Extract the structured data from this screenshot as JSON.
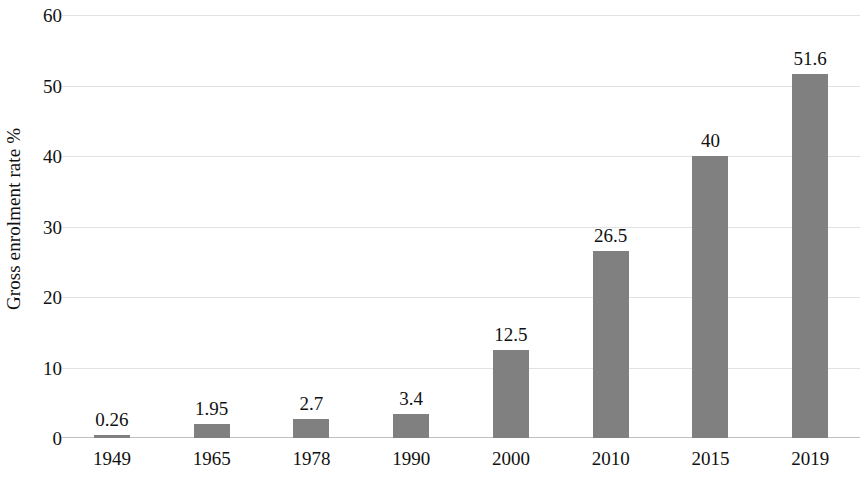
{
  "chart_data": {
    "type": "bar",
    "title": "",
    "subtitle": "",
    "xlabel": "",
    "ylabel": "Gross enrolment rate %",
    "categories": [
      "1949",
      "1965",
      "1978",
      "1990",
      "2000",
      "2010",
      "2015",
      "2019"
    ],
    "values": [
      0.26,
      1.95,
      2.7,
      3.4,
      12.5,
      26.5,
      40,
      51.6
    ],
    "value_labels": [
      "0.26",
      "1.95",
      "2.7",
      "3.4",
      "12.5",
      "26.5",
      "40",
      "51.6"
    ],
    "series": [
      {
        "name": "Gross enrolment rate %",
        "values": [
          0.26,
          1.95,
          2.7,
          3.4,
          12.5,
          26.5,
          40,
          51.6
        ]
      }
    ],
    "ylim": [
      0,
      60
    ],
    "xlim": null,
    "y_ticks": [
      0,
      10,
      20,
      30,
      40,
      50,
      60
    ],
    "y_tick_labels": [
      "0",
      "10",
      "20",
      "30",
      "40",
      "50",
      "60"
    ],
    "grid": true,
    "grid_axis": "y",
    "legend": false,
    "legend_position": "none",
    "bar_color": "#808080",
    "gridline_color": "#e2e2e2",
    "axis_color": "#bfbfbf",
    "text_color": "#111111",
    "background_color": "#ffffff",
    "data_labels_shown": true,
    "annotations": []
  }
}
